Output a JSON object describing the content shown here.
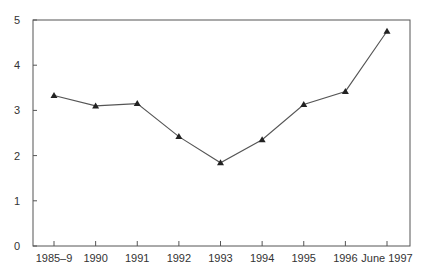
{
  "chart_data": {
    "type": "line",
    "title": "",
    "xlabel": "",
    "ylabel": "",
    "categories": [
      "1985–9",
      "1990",
      "1991",
      "1992",
      "1993",
      "1994",
      "1995",
      "1996",
      "June 1997"
    ],
    "series": [
      {
        "name": "",
        "marker": "triangle",
        "values": [
          3.33,
          3.1,
          3.15,
          2.42,
          1.84,
          2.35,
          3.13,
          3.42,
          4.75
        ]
      }
    ],
    "ylim": [
      0,
      5
    ],
    "yticks": [
      0,
      1,
      2,
      3,
      4,
      5
    ],
    "grid": false,
    "legend": "none",
    "frame": "box"
  },
  "colors": {
    "axis": "#555555",
    "line": "#555555",
    "marker": "#222222",
    "text": "#333333"
  }
}
